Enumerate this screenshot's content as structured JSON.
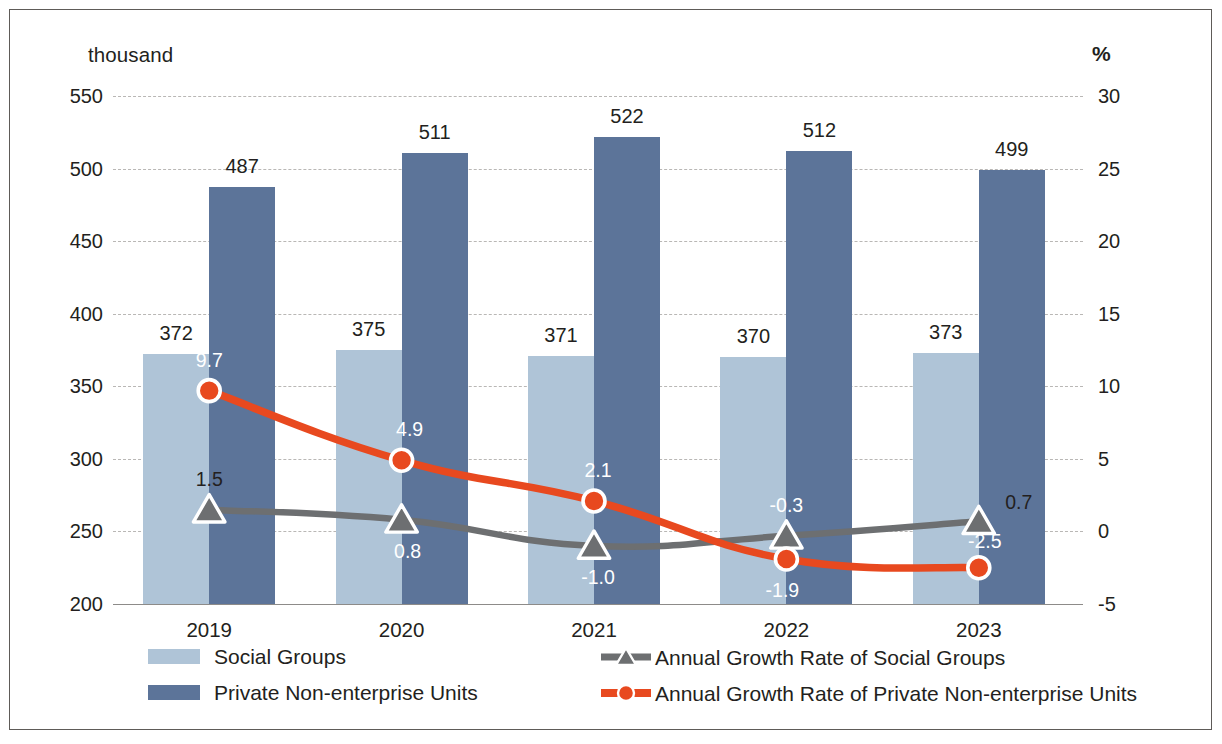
{
  "axes": {
    "left_unit": "thousand",
    "right_unit": "%",
    "left_ticks": [
      "550",
      "500",
      "450",
      "400",
      "350",
      "300",
      "250",
      "200"
    ],
    "right_ticks": [
      "30",
      "25",
      "20",
      "15",
      "10",
      "5",
      "0",
      "-5"
    ],
    "x_labels": [
      "2019",
      "2020",
      "2021",
      "2022",
      "2023"
    ]
  },
  "legend": {
    "items": [
      {
        "label": "Social Groups",
        "key": "bar-swatch-light",
        "color": "#afc4d7"
      },
      {
        "label": "Private Non-enterprise Units",
        "key": "bar-swatch-dark",
        "color": "#5c7499"
      },
      {
        "label": "Annual Growth Rate of Social Groups",
        "key": "line-triangle-gray",
        "color": "#6d6f71"
      },
      {
        "label": "Annual Growth Rate of Private Non-enterprise Units",
        "key": "line-circle-orange",
        "color": "#e8491f"
      }
    ]
  },
  "colors": {
    "bar_light": "#afc4d7",
    "bar_dark": "#5c7499",
    "line_gray": "#6d6f71",
    "line_orange": "#e8491f",
    "gridline": "#b9b7b5",
    "text": "#231f20"
  },
  "chart_data": {
    "type": "bar",
    "title": "",
    "subtitle": "",
    "xlabel": "",
    "ylabel": "thousand",
    "y2label": "%",
    "categories": [
      "2019",
      "2020",
      "2021",
      "2022",
      "2023"
    ],
    "ylim": [
      200,
      550
    ],
    "y2lim": [
      -5,
      30
    ],
    "grid": true,
    "legend_position": "bottom",
    "series": [
      {
        "name": "Social Groups",
        "type": "bar",
        "axis": "left",
        "color": "#afc4d7",
        "values": [
          372,
          375,
          371,
          370,
          373
        ],
        "labels": [
          "372",
          "375",
          "371",
          "370",
          "373"
        ]
      },
      {
        "name": "Private Non-enterprise Units",
        "type": "bar",
        "axis": "left",
        "color": "#5c7499",
        "values": [
          487,
          511,
          522,
          512,
          499
        ],
        "labels": [
          "487",
          "511",
          "522",
          "512",
          "499"
        ]
      },
      {
        "name": "Annual Growth Rate of Social Groups",
        "type": "line",
        "axis": "right",
        "color": "#6d6f71",
        "marker": "triangle",
        "values": [
          1.5,
          0.8,
          -1.0,
          -0.3,
          0.7
        ],
        "labels": [
          "1.5",
          "0.8",
          "-1.0",
          "-0.3",
          "0.7"
        ]
      },
      {
        "name": "Annual Growth Rate of Private Non-enterprise Units",
        "type": "line",
        "axis": "right",
        "color": "#e8491f",
        "marker": "circle",
        "values": [
          9.7,
          4.9,
          2.1,
          -1.9,
          -2.5
        ],
        "labels": [
          "9.7",
          "4.9",
          "2.1",
          "-1.9",
          "-2.5"
        ]
      }
    ]
  }
}
